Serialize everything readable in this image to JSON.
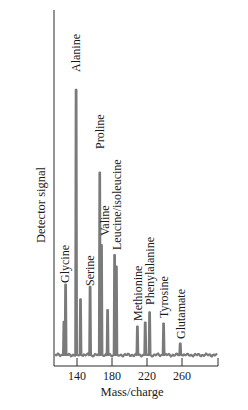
{
  "chart_data": {
    "type": "line",
    "title": "",
    "xlabel": "Mass/charge",
    "ylabel": "Detector signal",
    "xlim": [
      113,
      300
    ],
    "ylim": [
      0,
      100
    ],
    "x_ticks": [
      140,
      180,
      220,
      260
    ],
    "x_tick_labels": [
      "140",
      "180",
      "220",
      "260"
    ],
    "y_ticks": [],
    "grid": false,
    "legend": null,
    "colors": {
      "trace": "#7a7a7a",
      "axis": "#2a2a2a",
      "text": "#1a1a1a"
    },
    "peaks": [
      {
        "label": "",
        "mz": 125,
        "height": 11.6
      },
      {
        "label": "Glycine",
        "mz": 127,
        "height": 24.7
      },
      {
        "label": "Alanine",
        "mz": 139,
        "height": 93.0
      },
      {
        "label": "",
        "mz": 144,
        "height": 19.5
      },
      {
        "label": "Serine",
        "mz": 155,
        "height": 23.9
      },
      {
        "label": "Proline",
        "mz": 166,
        "height": 64.0
      },
      {
        "label": "Valine",
        "mz": 168,
        "height": 38.6
      },
      {
        "label": "",
        "mz": 175,
        "height": 15.8
      },
      {
        "label": "Leucine/isoleucine",
        "mz": 183,
        "height": 35.1
      },
      {
        "label": "",
        "mz": 185,
        "height": 31.0
      },
      {
        "label": "Methionine",
        "mz": 209,
        "height": 10.0
      },
      {
        "label": "",
        "mz": 218,
        "height": 11.4
      },
      {
        "label": "Phenylalanine",
        "mz": 223,
        "height": 15.0
      },
      {
        "label": "Tyrosine",
        "mz": 239,
        "height": 11.0
      },
      {
        "label": "Glutamate",
        "mz": 258,
        "height": 4.0
      }
    ],
    "annotations": [
      "Glycine",
      "Alanine",
      "Serine",
      "Valine",
      "Proline",
      "Leucine/isoleucine",
      "Methionine",
      "Phenylalanine",
      "Tyrosine",
      "Glutamate"
    ]
  }
}
